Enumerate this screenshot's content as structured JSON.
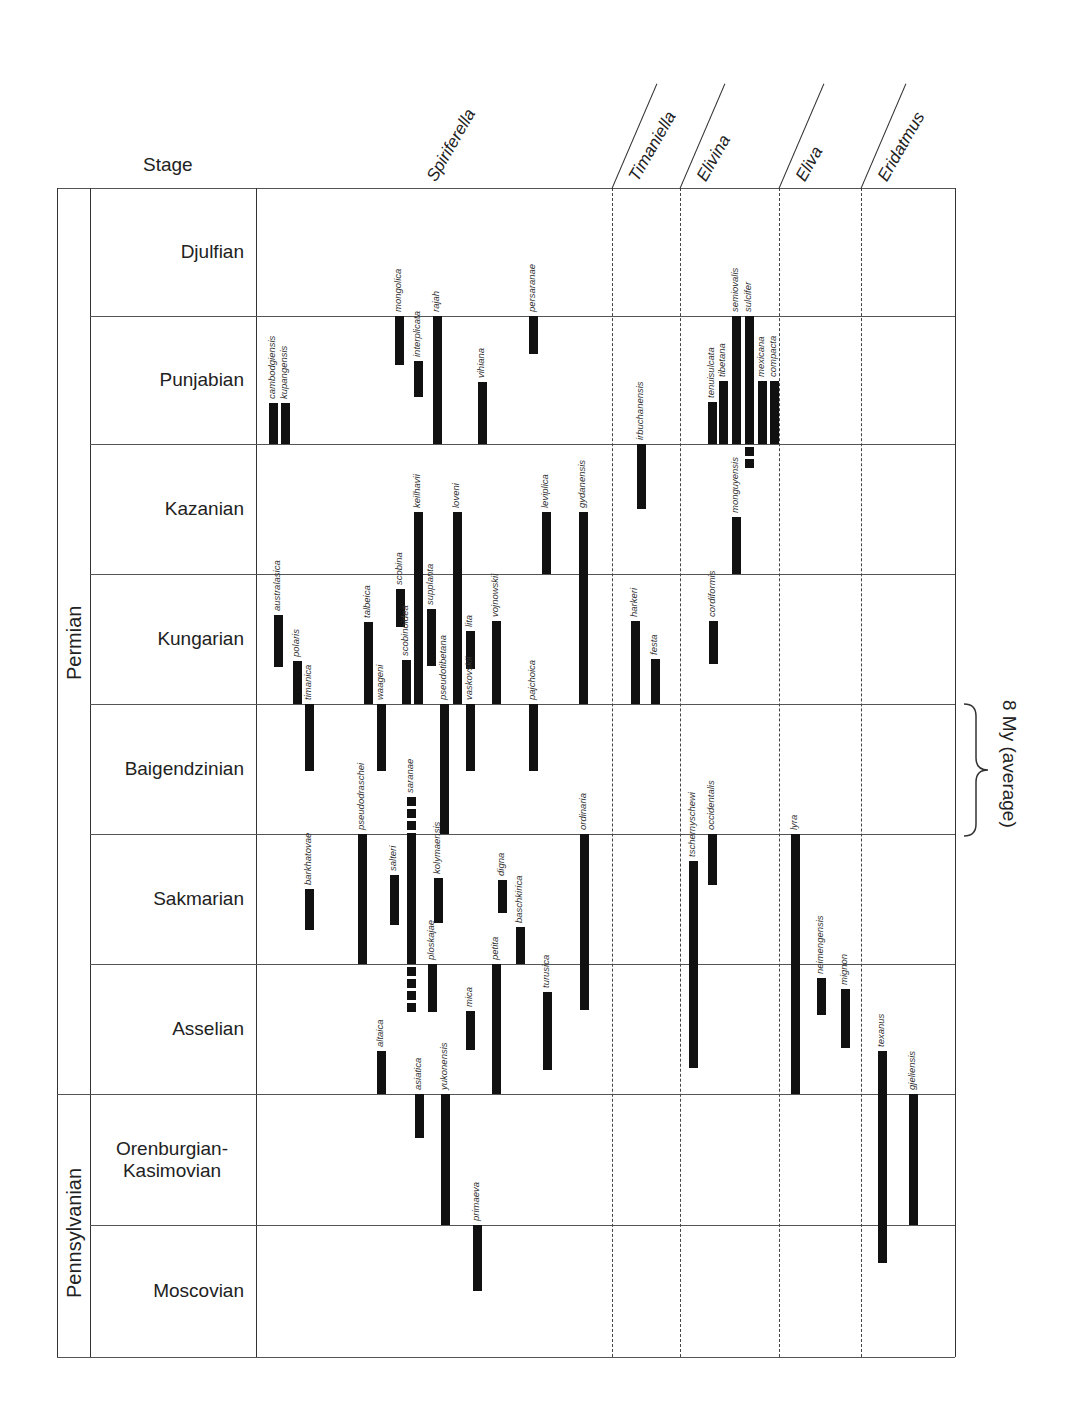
{
  "header": {
    "stage_label": "Stage"
  },
  "periods": [
    {
      "name": "Permian",
      "top": 188,
      "bottom": 1094
    },
    {
      "name": "Pennsylvanian",
      "top": 1094,
      "bottom": 1357
    }
  ],
  "stages": [
    {
      "name": "Djulfian",
      "top": 188,
      "bottom": 316
    },
    {
      "name": "Punjabian",
      "top": 316,
      "bottom": 444
    },
    {
      "name": "Kazanian",
      "top": 444,
      "bottom": 574
    },
    {
      "name": "Kungarian",
      "top": 574,
      "bottom": 704
    },
    {
      "name": "Baigendzinian",
      "top": 704,
      "bottom": 834
    },
    {
      "name": "Sakmarian",
      "top": 834,
      "bottom": 964
    },
    {
      "name": "Asselian",
      "top": 964,
      "bottom": 1094
    },
    {
      "name": "Orenburgian-\nKasimovian",
      "top": 1094,
      "bottom": 1225
    },
    {
      "name": "Moscovian",
      "top": 1225,
      "bottom": 1357
    }
  ],
  "genera": [
    {
      "name": "Spiriferella",
      "x0": 256,
      "x1": 612
    },
    {
      "name": "Timaniella",
      "x0": 612,
      "x1": 680
    },
    {
      "name": "Elivina",
      "x0": 680,
      "x1": 779
    },
    {
      "name": "Eliva",
      "x0": 779,
      "x1": 861
    },
    {
      "name": "Eridatmus",
      "x0": 861,
      "x1": 955
    }
  ],
  "annotation": {
    "text": "8 My (average)",
    "top": 704,
    "bottom": 834
  },
  "chart_data": {
    "type": "range-bar (stratigraphic range chart)",
    "title": "",
    "xlabel": "Genus / species",
    "ylabel": "Stage",
    "stage_order_top_to_bottom": [
      "Djulfian",
      "Punjabian",
      "Kazanian",
      "Kungarian",
      "Baigendzinian",
      "Sakmarian",
      "Asselian",
      "Orenburgian-Kasimovian",
      "Moscovian"
    ],
    "annotation": "8 My (average) stage duration",
    "series": [
      {
        "genus": "Spiriferella",
        "species": "cambodgiensis",
        "x": 273,
        "top": 403,
        "bottom": 444
      },
      {
        "genus": "Spiriferella",
        "species": "kupangensis",
        "x": 285,
        "top": 403,
        "bottom": 444
      },
      {
        "genus": "Spiriferella",
        "species": "australasica",
        "x": 278,
        "top": 615,
        "bottom": 667
      },
      {
        "genus": "Spiriferella",
        "species": "polaris",
        "x": 297,
        "top": 661,
        "bottom": 704
      },
      {
        "genus": "Spiriferella",
        "species": "timanica",
        "x": 309,
        "top": 704,
        "bottom": 771
      },
      {
        "genus": "Spiriferella",
        "species": "barkhatovae",
        "x": 309,
        "top": 889,
        "bottom": 930
      },
      {
        "genus": "Spiriferella",
        "species": "pseudodraschei",
        "x": 362,
        "top": 834,
        "bottom": 964
      },
      {
        "genus": "Spiriferella",
        "species": "talbeica",
        "x": 368,
        "top": 622,
        "bottom": 704
      },
      {
        "genus": "Spiriferella",
        "species": "waageni",
        "x": 381,
        "top": 704,
        "bottom": 771
      },
      {
        "genus": "Spiriferella",
        "species": "altaica",
        "x": 381,
        "top": 1051,
        "bottom": 1094
      },
      {
        "genus": "Spiriferella",
        "species": "salteri",
        "x": 394,
        "top": 875,
        "bottom": 925
      },
      {
        "genus": "Spiriferella",
        "species": "mongolica",
        "x": 399,
        "top": 316,
        "bottom": 365
      },
      {
        "genus": "Spiriferella",
        "species": "scobina",
        "x": 400,
        "top": 589,
        "bottom": 627
      },
      {
        "genus": "Spiriferella",
        "species": "scobinoidea",
        "x": 406,
        "top": 660,
        "bottom": 704
      },
      {
        "genus": "Spiriferella",
        "species": "saranae",
        "x": 411,
        "top": 797,
        "bottom": 1004,
        "dashed_ends": true
      },
      {
        "genus": "Spiriferella",
        "species": "interplicata",
        "x": 418,
        "top": 361,
        "bottom": 397
      },
      {
        "genus": "Spiriferella",
        "species": "keilhavii",
        "x": 418,
        "top": 512,
        "bottom": 704
      },
      {
        "genus": "Spiriferella",
        "species": "asiatica",
        "x": 419,
        "top": 1094,
        "bottom": 1138
      },
      {
        "genus": "Spiriferella",
        "species": "ploskajae",
        "x": 432,
        "top": 964,
        "bottom": 1012
      },
      {
        "genus": "Spiriferella",
        "species": "supplanta",
        "x": 431,
        "top": 609,
        "bottom": 666
      },
      {
        "genus": "Spiriferella",
        "species": "rajah",
        "x": 437,
        "top": 316,
        "bottom": 444
      },
      {
        "genus": "Spiriferella",
        "species": "kolymaensis",
        "x": 438,
        "top": 878,
        "bottom": 923
      },
      {
        "genus": "Spiriferella",
        "species": "pseudotibetana",
        "x": 444,
        "top": 704,
        "bottom": 834
      },
      {
        "genus": "Spiriferella",
        "species": "yukonensis",
        "x": 445,
        "top": 1094,
        "bottom": 1225
      },
      {
        "genus": "Spiriferella",
        "species": "loveni",
        "x": 457,
        "top": 512,
        "bottom": 704
      },
      {
        "genus": "Spiriferella",
        "species": "lita",
        "x": 470,
        "top": 631,
        "bottom": 669
      },
      {
        "genus": "Spiriferella",
        "species": "vaskovskii",
        "x": 470,
        "top": 704,
        "bottom": 771
      },
      {
        "genus": "Spiriferella",
        "species": "mica",
        "x": 470,
        "top": 1011,
        "bottom": 1050
      },
      {
        "genus": "Spiriferella",
        "species": "primaeva",
        "x": 477,
        "top": 1225,
        "bottom": 1291
      },
      {
        "genus": "Spiriferella",
        "species": "vihiana",
        "x": 482,
        "top": 382,
        "bottom": 444
      },
      {
        "genus": "Spiriferella",
        "species": "vojnowskii",
        "x": 496,
        "top": 621,
        "bottom": 704
      },
      {
        "genus": "Spiriferella",
        "species": "petita",
        "x": 496,
        "top": 964,
        "bottom": 1094
      },
      {
        "genus": "Spiriferella",
        "species": "digna",
        "x": 502,
        "top": 880,
        "bottom": 913
      },
      {
        "genus": "Spiriferella",
        "species": "baschkirica",
        "x": 520,
        "top": 927,
        "bottom": 964
      },
      {
        "genus": "Spiriferella",
        "species": "persaranae",
        "x": 533,
        "top": 316,
        "bottom": 354
      },
      {
        "genus": "Spiriferella",
        "species": "pajchoica",
        "x": 533,
        "top": 704,
        "bottom": 771
      },
      {
        "genus": "Spiriferella",
        "species": "turusica",
        "x": 547,
        "top": 992,
        "bottom": 1070
      },
      {
        "genus": "Spiriferella",
        "species": "leviplica",
        "x": 546,
        "top": 512,
        "bottom": 574
      },
      {
        "genus": "Spiriferella",
        "species": "gydanensis",
        "x": 583,
        "top": 512,
        "bottom": 704
      },
      {
        "genus": "Spiriferella",
        "species": "ordinaria",
        "x": 584,
        "top": 834,
        "bottom": 1010
      },
      {
        "genus": "Timaniella",
        "species": "irbuchanensis",
        "x": 641,
        "top": 444,
        "bottom": 509
      },
      {
        "genus": "Timaniella",
        "species": "harkeri",
        "x": 635,
        "top": 621,
        "bottom": 704
      },
      {
        "genus": "Timaniella",
        "species": "festa",
        "x": 655,
        "top": 659,
        "bottom": 704
      },
      {
        "genus": "Elivina",
        "species": "tschernyschewi",
        "x": 693,
        "top": 861,
        "bottom": 1068
      },
      {
        "genus": "Elivina",
        "species": "occidentalis",
        "x": 712,
        "top": 834,
        "bottom": 885
      },
      {
        "genus": "Elivina",
        "species": "cordiformis",
        "x": 713,
        "top": 621,
        "bottom": 664
      },
      {
        "genus": "Elivina",
        "species": "tenuisulcata",
        "x": 712,
        "top": 402,
        "bottom": 444
      },
      {
        "genus": "Elivina",
        "species": "tibetana",
        "x": 723,
        "top": 381,
        "bottom": 444
      },
      {
        "genus": "Elivina",
        "species": "semiovalis",
        "x": 736,
        "top": 316,
        "bottom": 444
      },
      {
        "genus": "Elivina",
        "species": "monguyensis",
        "x": 736,
        "top": 517,
        "bottom": 574
      },
      {
        "genus": "Elivina",
        "species": "sulcifer",
        "x": 749,
        "top": 316,
        "bottom": 470,
        "dashed_ends": true
      },
      {
        "genus": "Elivina",
        "species": "mexicana",
        "x": 762,
        "top": 381,
        "bottom": 444
      },
      {
        "genus": "Elivina",
        "species": "compacta",
        "x": 774,
        "top": 381,
        "bottom": 444
      },
      {
        "genus": "Eliva",
        "species": "lyra",
        "x": 795,
        "top": 834,
        "bottom": 1094
      },
      {
        "genus": "Eliva",
        "species": "neimengensis",
        "x": 821,
        "top": 978,
        "bottom": 1015
      },
      {
        "genus": "Eliva",
        "species": "mignon",
        "x": 845,
        "top": 989,
        "bottom": 1048
      },
      {
        "genus": "Eridatmus",
        "species": "texanus",
        "x": 882,
        "top": 1051,
        "bottom": 1263
      },
      {
        "genus": "Eridatmus",
        "species": "gjeliensis",
        "x": 913,
        "top": 1094,
        "bottom": 1225
      }
    ]
  }
}
